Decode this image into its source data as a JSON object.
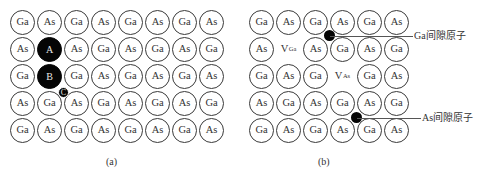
{
  "panel_a": {
    "caption": "(a)",
    "rows": [
      [
        "Ga",
        "As",
        "Ga",
        "As",
        "Ga",
        "As",
        "Ga",
        "As"
      ],
      [
        "As",
        "A",
        "As",
        "Ga",
        "As",
        "Ga",
        "As",
        "Ga"
      ],
      [
        "Ga",
        "B",
        "Ga",
        "As",
        "Ga",
        "As",
        "Ga",
        "As"
      ],
      [
        "As",
        "Ga",
        "As",
        "Ga",
        "As",
        "Ga",
        "As",
        "Ga"
      ],
      [
        "Ga",
        "As",
        "Ga",
        "As",
        "Ga",
        "As",
        "Ga",
        "As"
      ]
    ],
    "highlighted": [
      {
        "row": 1,
        "col": 1,
        "label": "A"
      },
      {
        "row": 2,
        "col": 1,
        "label": "B"
      }
    ],
    "small_atom": {
      "label": "C"
    }
  },
  "panel_b": {
    "caption": "(b)",
    "rows": [
      [
        "Ga",
        "As",
        "Ga",
        "As",
        "Ga",
        "As"
      ],
      [
        "As",
        "V_Ga",
        "As",
        "Ga",
        "As",
        "Ga"
      ],
      [
        "Ga",
        "As",
        "Ga",
        "V_As",
        "Ga",
        "As"
      ],
      [
        "As",
        "Ga",
        "As",
        "Ga",
        "As",
        "Ga"
      ],
      [
        "Ga",
        "As",
        "Ga",
        "As",
        "Ga",
        "As"
      ]
    ],
    "vacancies": [
      {
        "row": 1,
        "col": 1,
        "symbol": "V",
        "subscript": "Ga"
      },
      {
        "row": 2,
        "col": 3,
        "symbol": "V",
        "subscript": "As"
      }
    ],
    "interstitials": [
      {
        "label": "Ga间隙原子"
      },
      {
        "label": "As间隙原子"
      }
    ]
  }
}
